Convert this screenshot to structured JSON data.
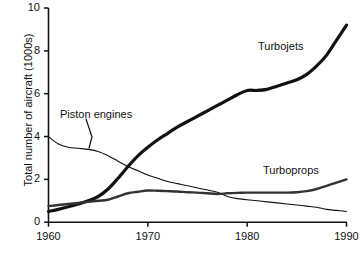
{
  "chart_data": {
    "type": "line",
    "title": "",
    "subtitle": "",
    "xlabel": "",
    "ylabel": "Total number of aircraft (1000s)",
    "xlim": [
      1960,
      1990
    ],
    "ylim": [
      0,
      10
    ],
    "xticks": [
      "1960",
      "1970",
      "1980",
      "1990"
    ],
    "xtick_values": [
      1960,
      1970,
      1980,
      1990
    ],
    "yticks": [
      "0",
      "2",
      "4",
      "6",
      "8",
      "10"
    ],
    "ytick_values": [
      0,
      2,
      4,
      6,
      8,
      10
    ],
    "grid": false,
    "legend_position": "inline-annotations",
    "annotations": [
      {
        "text": "Turbojets",
        "series": "Turbojets",
        "x": 1981,
        "y": 8.05
      },
      {
        "text": "Piston engines",
        "series": "Piston engines",
        "x": 1961.2,
        "y": 5.4,
        "leader_line": true
      },
      {
        "text": "Turboprops",
        "series": "Turboprops",
        "x": 1981.5,
        "y": 2.75
      }
    ],
    "series": [
      {
        "name": "Turbojets",
        "color": "#111111",
        "line_width": 3.2,
        "x": [
          1960,
          1961,
          1962,
          1963,
          1964,
          1965,
          1966,
          1967,
          1968,
          1969,
          1970,
          1971,
          1972,
          1973,
          1974,
          1975,
          1976,
          1977,
          1978,
          1979,
          1980,
          1981,
          1982,
          1983,
          1984,
          1985,
          1986,
          1987,
          1988,
          1989,
          1990
        ],
        "values": [
          0.5,
          0.6,
          0.72,
          0.85,
          1.0,
          1.2,
          1.55,
          2.05,
          2.6,
          3.1,
          3.5,
          3.85,
          4.15,
          4.45,
          4.7,
          4.95,
          5.2,
          5.45,
          5.7,
          5.95,
          6.15,
          6.15,
          6.2,
          6.35,
          6.5,
          6.65,
          6.9,
          7.3,
          7.8,
          8.5,
          9.2
        ]
      },
      {
        "name": "Piston engines",
        "color": "#111111",
        "line_width": 1.1,
        "x": [
          1960,
          1961,
          1962,
          1963,
          1964,
          1965,
          1966,
          1967,
          1968,
          1969,
          1970,
          1971,
          1972,
          1973,
          1974,
          1975,
          1976,
          1977,
          1978,
          1979,
          1980,
          1981,
          1982,
          1983,
          1984,
          1985,
          1986,
          1987,
          1988,
          1989,
          1990
        ],
        "values": [
          4.0,
          3.65,
          3.5,
          3.45,
          3.4,
          3.3,
          3.1,
          2.85,
          2.6,
          2.4,
          2.2,
          2.05,
          1.9,
          1.8,
          1.7,
          1.6,
          1.5,
          1.4,
          1.2,
          1.1,
          1.05,
          1.0,
          0.95,
          0.9,
          0.85,
          0.8,
          0.75,
          0.7,
          0.6,
          0.55,
          0.5
        ]
      },
      {
        "name": "Turboprops",
        "color": "#333333",
        "line_width": 2.4,
        "x": [
          1960,
          1961,
          1962,
          1963,
          1964,
          1965,
          1966,
          1967,
          1968,
          1969,
          1970,
          1971,
          1972,
          1973,
          1974,
          1975,
          1976,
          1977,
          1978,
          1979,
          1980,
          1981,
          1982,
          1983,
          1984,
          1985,
          1986,
          1987,
          1988,
          1989,
          1990
        ],
        "values": [
          0.75,
          0.8,
          0.85,
          0.9,
          0.95,
          1.0,
          1.05,
          1.2,
          1.35,
          1.42,
          1.48,
          1.47,
          1.45,
          1.43,
          1.4,
          1.38,
          1.35,
          1.32,
          1.35,
          1.37,
          1.38,
          1.38,
          1.38,
          1.38,
          1.38,
          1.4,
          1.45,
          1.55,
          1.7,
          1.85,
          2.0
        ]
      }
    ]
  },
  "axis": {
    "y_title": "Total number of aircraft (1000s)"
  }
}
